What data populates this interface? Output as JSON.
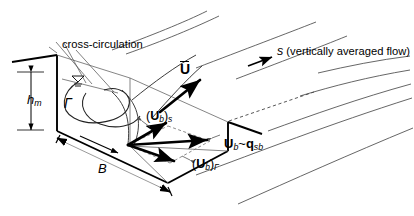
{
  "figure": {
    "type": "engineering-diagram",
    "background_color": "#ffffff",
    "line_color": "#000000",
    "thin_line_color": "#555555"
  },
  "annotations": {
    "cross_circulation": "cross-circulation",
    "depth_label": {
      "symbol": "h",
      "subscript": "m"
    },
    "width_label": {
      "symbol": "B"
    },
    "circulation_label": {
      "symbol": "Γ"
    },
    "stream_axis": {
      "symbol": "s",
      "description": "(vertically averaged flow)"
    },
    "depth_averaged_velocity": {
      "symbol": "U",
      "overbar": true
    },
    "bed_velocity_streamwise": {
      "symbol": "U",
      "subscript": "b",
      "outer_subscript": "s"
    },
    "bed_velocity_circulation": {
      "symbol": "U",
      "subscript": "b",
      "outer_subscript": "Γ"
    },
    "bed_velocity_resultant": {
      "symbol": "U",
      "subscript": "b",
      "relation": "~",
      "second_symbol": "q",
      "second_subscript": "sb"
    }
  },
  "vectors": [
    {
      "name": "depth-averaged-velocity",
      "label": "Ū"
    },
    {
      "name": "bed-velocity-streamwise",
      "label": "(U_b)_s"
    },
    {
      "name": "bed-velocity-circulation",
      "label": "(U_b)_Γ"
    },
    {
      "name": "bed-velocity-resultant",
      "label": "U_b ~ q_sb"
    },
    {
      "name": "stream-direction",
      "label": "s"
    }
  ]
}
